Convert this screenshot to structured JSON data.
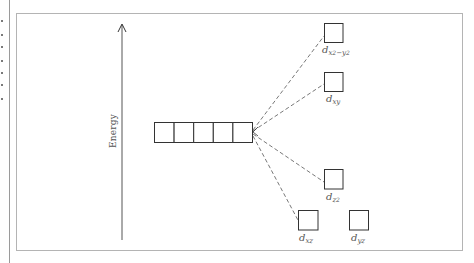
{
  "diagram": {
    "type": "crystal-field-splitting",
    "axis": {
      "label": "Energy",
      "direction": "up"
    },
    "degenerate_set": {
      "box_count": 5,
      "description": "five degenerate d orbitals"
    },
    "split_orbitals": [
      {
        "id": "dx2y2",
        "label_main": "d",
        "label_sub": "x",
        "label_sup1": "2",
        "label_mid": "−y",
        "label_sup2": "2",
        "text": "d x²−y²"
      },
      {
        "id": "dxy",
        "label_main": "d",
        "label_sub": "xy",
        "text": "d xy"
      },
      {
        "id": "dz2",
        "label_main": "d",
        "label_sub": "z",
        "label_sup1": "2",
        "text": "d z²"
      },
      {
        "id": "dxz",
        "label_main": "d",
        "label_sub": "xz",
        "text": "d xz"
      },
      {
        "id": "dyz",
        "label_main": "d",
        "label_sub": "yz",
        "text": "d yz"
      }
    ],
    "colors": {
      "line": "#333333",
      "frame": "#b4b4b4",
      "text": "#555555"
    }
  }
}
